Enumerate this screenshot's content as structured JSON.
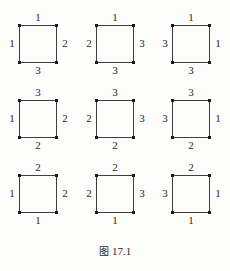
{
  "figure": {
    "caption_prefix": "图",
    "caption_number": "17.1",
    "top_remnant_text": "",
    "line_color": "#3f3f3f",
    "dot_color": "#1a1a1a",
    "background": "#fdfdfc",
    "grid": {
      "rows": 3,
      "columns": 3
    },
    "squares": [
      {
        "id": "square-1",
        "position": "top-left",
        "top": "1",
        "right": "2",
        "bottom": "3",
        "left": "1"
      },
      {
        "id": "square-2",
        "position": "top-center",
        "top": "1",
        "right": "3",
        "bottom": "3",
        "left": "2"
      },
      {
        "id": "square-3",
        "position": "top-right",
        "top": "1",
        "right": "1",
        "bottom": "3",
        "left": "3"
      },
      {
        "id": "square-4",
        "position": "middle-left",
        "top": "3",
        "right": "2",
        "bottom": "2",
        "left": "1"
      },
      {
        "id": "square-5",
        "position": "middle-center",
        "top": "3",
        "right": "3",
        "bottom": "2",
        "left": "2"
      },
      {
        "id": "square-6",
        "position": "middle-right",
        "top": "3",
        "right": "1",
        "bottom": "2",
        "left": "3"
      },
      {
        "id": "square-7",
        "position": "bottom-left",
        "top": "2",
        "right": "2",
        "bottom": "1",
        "left": "1"
      },
      {
        "id": "square-8",
        "position": "bottom-center",
        "top": "2",
        "right": "3",
        "bottom": "1",
        "left": "2"
      },
      {
        "id": "square-9",
        "position": "bottom-right",
        "top": "2",
        "right": "1",
        "bottom": "1",
        "left": "3"
      }
    ]
  }
}
